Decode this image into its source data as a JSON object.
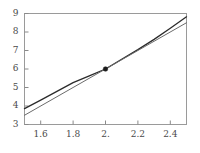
{
  "chart_data": {
    "type": "line",
    "title": "",
    "subtitle": "",
    "xlabel": "",
    "ylabel": "",
    "xlim": [
      1.5,
      2.5
    ],
    "ylim": [
      3,
      9
    ],
    "grid": false,
    "legend": null,
    "x_ticks": [
      1.6,
      1.8,
      2,
      2.2,
      2.4
    ],
    "x_tick_labels": [
      "1.6",
      "1.8",
      "2.",
      "2.2",
      "2.4"
    ],
    "y_ticks": [
      3,
      4,
      5,
      6,
      7,
      8,
      9
    ],
    "y_tick_labels": [
      "3",
      "4",
      "5",
      "6",
      "7",
      "8",
      "9"
    ],
    "series": [
      {
        "name": "curve",
        "color": "#2b2b2b",
        "width": 1.3,
        "x": [
          1.5,
          1.6,
          1.7,
          1.8,
          1.9,
          2.0,
          2.1,
          2.2,
          2.3,
          2.4,
          2.5
        ],
        "values": [
          3.86,
          4.32,
          4.79,
          5.26,
          5.63,
          6.0,
          6.53,
          7.05,
          7.6,
          8.2,
          8.82
        ]
      },
      {
        "name": "tangent-line",
        "color": "#6b6b6b",
        "width": 1.0,
        "x": [
          1.5,
          2.5
        ],
        "values": [
          3.5,
          8.5
        ]
      }
    ],
    "points": [
      {
        "name": "intersection-marker",
        "x": 2.0,
        "y": 6.0,
        "color": "#1c1c1c",
        "size": 4.6
      }
    ],
    "axes": {
      "frame_color": "#9a9a9a",
      "tick_color": "#8a8a8a",
      "label_color": "#4a4a4a",
      "background": "#ffffff"
    }
  }
}
